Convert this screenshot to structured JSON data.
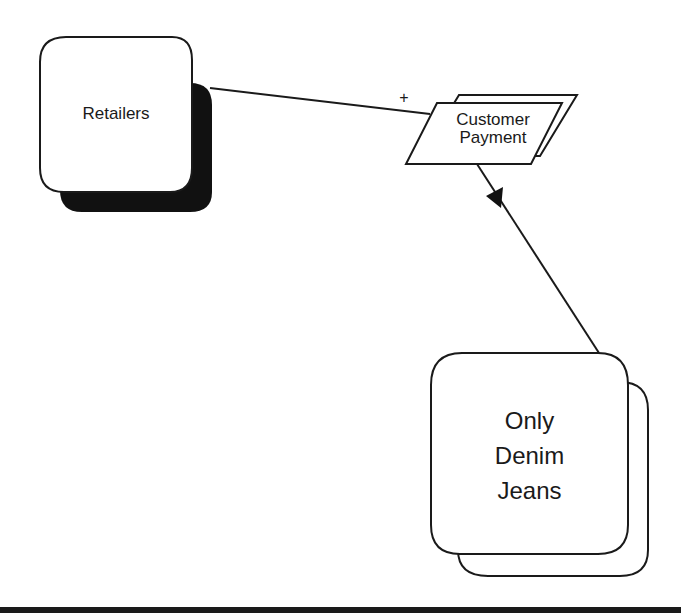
{
  "diagram": {
    "nodes": [
      {
        "id": "retailers",
        "label": "Retailers",
        "shape": "rounded-rect-shadow"
      },
      {
        "id": "customer_payment",
        "label_lines": [
          "Customer",
          "Payment"
        ],
        "shape": "parallelogram-stacked"
      },
      {
        "id": "only_denim_jeans",
        "label_lines": [
          "Only",
          "Denim",
          "Jeans"
        ],
        "shape": "rounded-rect-stacked"
      }
    ],
    "edges": [
      {
        "from": "retailers",
        "to": "customer_payment",
        "label": "+"
      },
      {
        "from": "customer_payment",
        "to": "only_denim_jeans",
        "arrow": "filled-triangle"
      }
    ],
    "colors": {
      "stroke": "#1a1a1a",
      "fill": "#ffffff",
      "shadow": "#111111"
    }
  }
}
